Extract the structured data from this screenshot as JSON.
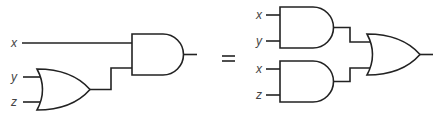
{
  "diagram": {
    "type": "logic-circuit-equivalence",
    "left_circuit": {
      "inputs": [
        "x",
        "y",
        "z"
      ],
      "gates": [
        {
          "id": "or1",
          "type": "OR",
          "inputs": [
            "y",
            "z"
          ]
        },
        {
          "id": "and1",
          "type": "AND",
          "inputs": [
            "x",
            "or1"
          ]
        }
      ],
      "output": "and1"
    },
    "equals_symbol": "=",
    "right_circuit": {
      "inputs": [
        "x",
        "y",
        "x",
        "z"
      ],
      "gates": [
        {
          "id": "and_a",
          "type": "AND",
          "inputs": [
            "x",
            "y"
          ]
        },
        {
          "id": "and_b",
          "type": "AND",
          "inputs": [
            "x",
            "z"
          ]
        },
        {
          "id": "or_out",
          "type": "OR",
          "inputs": [
            "and_a",
            "and_b"
          ]
        }
      ],
      "output": "or_out"
    },
    "labels": {
      "left_x": "x",
      "left_y": "y",
      "left_z": "z",
      "right_x1": "x",
      "right_y": "y",
      "right_x2": "x",
      "right_z": "z"
    },
    "colors": {
      "stroke": "#222222",
      "label": "#444444",
      "background": "#ffffff"
    }
  }
}
